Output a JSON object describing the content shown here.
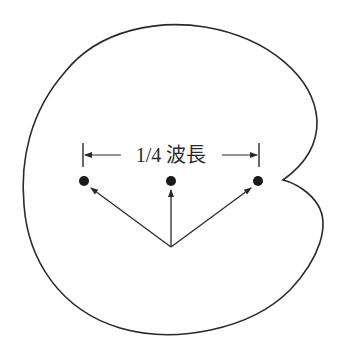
{
  "diagram": {
    "label": "1/4 波長",
    "colors": {
      "background": "#ffffff",
      "line": "#2a2a2a",
      "dot": "#1a1a1a"
    },
    "elements": {
      "outline": {
        "description": "cardioid-like radiation pattern outline with notch on the right",
        "shape": "cardioid"
      },
      "dots": [
        {
          "id": "left",
          "x": 84,
          "y": 181
        },
        {
          "id": "center",
          "x": 171,
          "y": 181
        },
        {
          "id": "right",
          "x": 258,
          "y": 181
        }
      ],
      "origin": {
        "x": 171,
        "y": 247
      },
      "arrows": [
        {
          "from": "origin",
          "to": "left"
        },
        {
          "from": "origin",
          "to": "center"
        },
        {
          "from": "origin",
          "to": "right"
        }
      ],
      "dimension": {
        "label": "1/4 波長",
        "left_tick_x": 83,
        "right_tick_x": 259,
        "y": 155
      }
    }
  }
}
